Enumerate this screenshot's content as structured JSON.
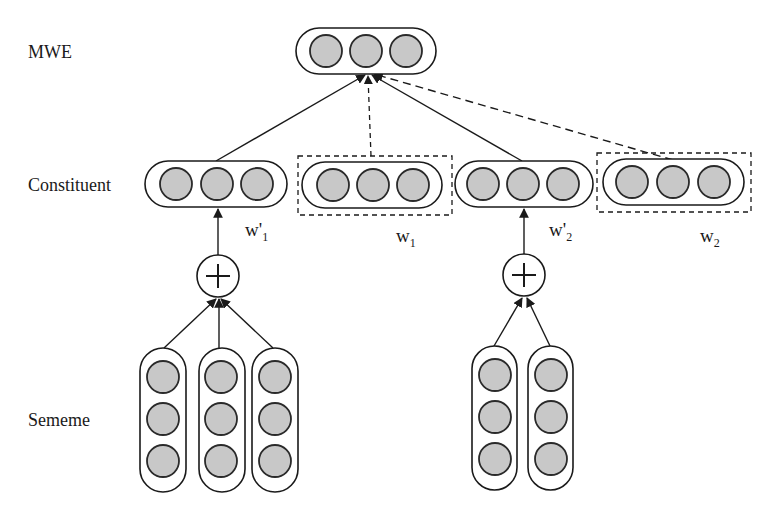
{
  "diagram": {
    "type": "neural-architecture",
    "row_labels": {
      "mwe": "MWE",
      "constituent": "Constituent",
      "sememe": "Sememe"
    },
    "variables": {
      "w_prime_1": {
        "base": "w'",
        "sub": "1"
      },
      "w_1": {
        "base": "w",
        "sub": "1"
      },
      "w_prime_2": {
        "base": "w'",
        "sub": "2"
      },
      "w_2": {
        "base": "w",
        "sub": "2"
      }
    },
    "operator_symbol": "+",
    "colors": {
      "node_fill": "#c8c8c8",
      "stroke": "#1a1a1a",
      "background": "#ffffff"
    },
    "nodes": {
      "mwe_vector": {
        "units": 3
      },
      "constituent_w_prime_1": {
        "units": 3
      },
      "constituent_w_1": {
        "units": 3,
        "boxed": true
      },
      "constituent_w_prime_2": {
        "units": 3
      },
      "constituent_w_2": {
        "units": 3,
        "boxed": true
      },
      "sememe_group_1": {
        "columns": 3,
        "units_per_column": 3
      },
      "sememe_group_2": {
        "columns": 2,
        "units_per_column": 3
      }
    },
    "edges": [
      {
        "from": "constituent_w_prime_1",
        "to": "mwe_vector",
        "style": "solid"
      },
      {
        "from": "constituent_w_1",
        "to": "mwe_vector",
        "style": "dashed"
      },
      {
        "from": "constituent_w_prime_2",
        "to": "mwe_vector",
        "style": "solid"
      },
      {
        "from": "constituent_w_2",
        "to": "mwe_vector",
        "style": "dashed"
      },
      {
        "from": "plus_1",
        "to": "constituent_w_prime_1",
        "style": "solid"
      },
      {
        "from": "plus_2",
        "to": "constituent_w_prime_2",
        "style": "solid"
      },
      {
        "from": "sememe_group_1",
        "to": "plus_1",
        "style": "solid"
      },
      {
        "from": "sememe_group_2",
        "to": "plus_2",
        "style": "solid"
      }
    ]
  }
}
